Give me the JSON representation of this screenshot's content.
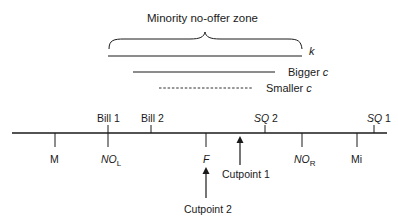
{
  "diagram": {
    "title": "Minority no-offer zone",
    "ranges": [
      {
        "id": "k",
        "label": "k",
        "style": "solid",
        "x1": 108,
        "x2": 302,
        "y": 56
      },
      {
        "id": "bigger-c",
        "label_text": "Bigger ",
        "label_var": "c",
        "style": "solid",
        "x1": 133,
        "x2": 275,
        "y": 72
      },
      {
        "id": "smaller-c",
        "label_text": "Smaller ",
        "label_var": "c",
        "style": "dashed",
        "x1": 159,
        "x2": 252,
        "y": 88
      }
    ],
    "axis": {
      "x1": 12,
      "x2": 387,
      "y": 133
    },
    "ticks_above": [
      {
        "label": "Bill 1",
        "x": 108
      },
      {
        "label": "Bill 2",
        "x": 151
      },
      {
        "label_var": "SQ",
        "label_num": " 2",
        "x": 265
      },
      {
        "label_var": "SQ",
        "label_num": " 1",
        "x": 374
      }
    ],
    "ticks_below": [
      {
        "label": "M",
        "x": 55
      },
      {
        "label_var": "NO",
        "label_sub": "L",
        "x": 108
      },
      {
        "label_var": "F",
        "x": 206
      },
      {
        "label_var": "NO",
        "label_sub": "R",
        "x": 302
      },
      {
        "label": "Mi",
        "x": 357
      }
    ],
    "arrows": [
      {
        "label": "Cutpoint 1",
        "x": 240,
        "y_from": 165,
        "y_to": 137
      },
      {
        "label": "Cutpoint 2",
        "x": 206,
        "y_from": 198,
        "y_to": 168
      }
    ]
  }
}
